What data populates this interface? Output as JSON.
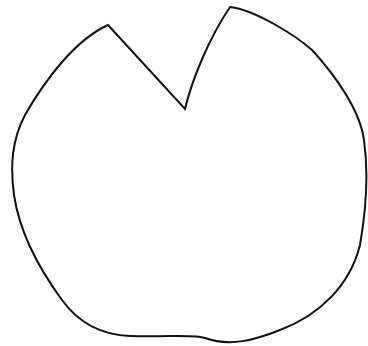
{
  "figure": {
    "background_color": "#ffffff",
    "stroke_color": "#111111",
    "stroke_width": 2,
    "fill_color": "#ffffff",
    "key_points": {
      "left_lobe_tip": [
        108,
        25
      ],
      "notch_vertex": [
        185,
        109
      ],
      "right_lobe_tip": [
        230,
        7
      ],
      "leftmost": [
        13,
        165
      ],
      "rightmost": [
        366,
        170
      ],
      "bottom": [
        225,
        344
      ]
    }
  }
}
